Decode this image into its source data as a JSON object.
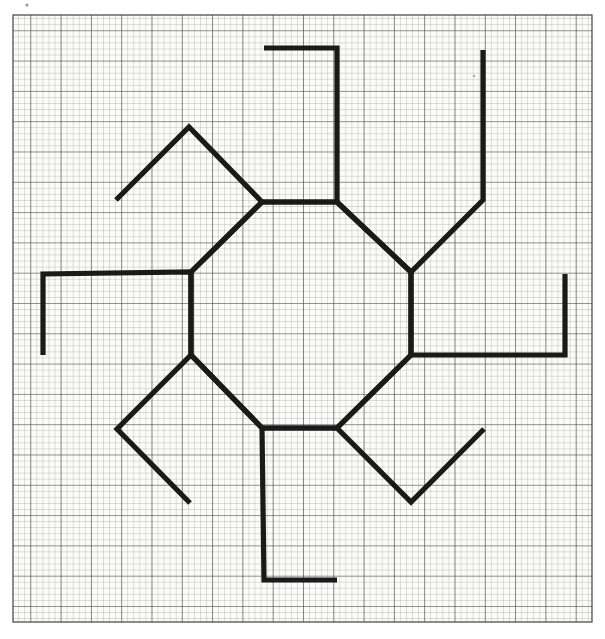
{
  "page": {
    "width": 605,
    "height": 639,
    "background_color": "#ffffff"
  },
  "paper": {
    "name": "graph-paper",
    "paper_color": "#fbfbf8",
    "fine_grid_color": "#7c7c7c",
    "major_grid_color": "#3c3c3c",
    "fine_spacing_px": 6.06,
    "major_every_n_cells": 5,
    "fine_line_width": 0.55,
    "major_line_width": 1.1,
    "left": 13,
    "top": 15,
    "right": 592,
    "bottom": 622,
    "cols": 95,
    "rows": 100
  },
  "figure": {
    "name": "octagon-net",
    "stroke_color": "#1a1a1a",
    "stroke_width": 5.2,
    "fill": "none",
    "center_x": 301.5,
    "center_y": 315.0
  },
  "chart_data": {
    "type": "diagram",
    "units": "grid squares (1 square = 6.06 px)",
    "octagon": {
      "label": "central regular octagon",
      "edge_length_px": 75,
      "vertices": [
        [
          262,
          202
        ],
        [
          337,
          202
        ],
        [
          411,
          272
        ],
        [
          411,
          355
        ],
        [
          337,
          428
        ],
        [
          262,
          428
        ],
        [
          191,
          355
        ],
        [
          191,
          272
        ]
      ]
    },
    "flaps": [
      {
        "name": "flap-top",
        "orientation": "axis-vertical",
        "depth_px": 154,
        "points": [
          [
            262,
            202
          ],
          [
            337,
            202
          ],
          [
            337,
            48
          ],
          [
            264,
            48
          ]
        ]
      },
      {
        "name": "flap-top-right",
        "orientation": "diagonal",
        "depth_px": 105,
        "points": [
          [
            337,
            202
          ],
          [
            411,
            272
          ],
          [
            483,
            200
          ],
          [
            483,
            50
          ]
        ]
      },
      {
        "name": "flap-right",
        "orientation": "axis-horizontal",
        "depth_px": 154,
        "points": [
          [
            411,
            272
          ],
          [
            411,
            355
          ],
          [
            565,
            355
          ],
          [
            565,
            274
          ]
        ]
      },
      {
        "name": "flap-bottom-right",
        "orientation": "diagonal",
        "depth_px": 105,
        "points": [
          [
            411,
            355
          ],
          [
            337,
            428
          ],
          [
            411,
            502
          ],
          [
            484,
            429
          ]
        ]
      },
      {
        "name": "flap-bottom",
        "orientation": "axis-vertical",
        "depth_px": 154,
        "points": [
          [
            337,
            428
          ],
          [
            262,
            428
          ],
          [
            264,
            580
          ],
          [
            337,
            580
          ]
        ]
      },
      {
        "name": "flap-bottom-left",
        "orientation": "diagonal",
        "depth_px": 105,
        "points": [
          [
            262,
            428
          ],
          [
            191,
            355
          ],
          [
            117,
            429
          ],
          [
            190,
            503
          ]
        ]
      },
      {
        "name": "flap-left",
        "orientation": "axis-horizontal",
        "depth_px": 154,
        "points": [
          [
            191,
            355
          ],
          [
            191,
            272
          ],
          [
            43,
            274
          ],
          [
            43,
            355
          ]
        ]
      },
      {
        "name": "flap-top-left",
        "orientation": "diagonal",
        "depth_px": 105,
        "points": [
          [
            191,
            272
          ],
          [
            262,
            202
          ],
          [
            189,
            127
          ],
          [
            116,
            200
          ]
        ]
      }
    ],
    "diamond_tips": {
      "top_left": [
        116,
        50
      ],
      "top_right": [
        483,
        50
      ],
      "bottom_left": [
        116,
        580
      ],
      "bottom_right": [
        484,
        580
      ],
      "left_top": [
        47,
        125
      ],
      "right_top": [
        556,
        125
      ],
      "left_bottom": [
        47,
        505
      ],
      "right_bottom": [
        556,
        505
      ]
    },
    "xlabel": "",
    "ylabel": "",
    "grid": true,
    "legend": "none"
  },
  "marks": {
    "speck_top_left": {
      "x": 27,
      "y": 5,
      "r": 1.6
    },
    "speck_top_right": {
      "x": 474,
      "y": 76,
      "r": 1.3
    }
  }
}
